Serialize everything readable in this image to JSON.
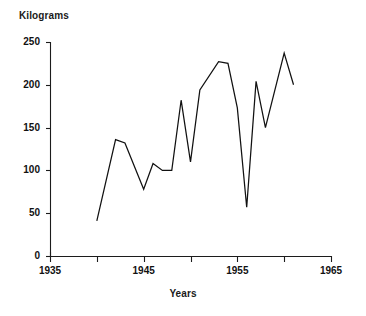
{
  "chart_data": {
    "type": "line",
    "title": "",
    "xlabel": "Years",
    "ylabel": "Kilograms",
    "xlim": [
      1935,
      1965
    ],
    "ylim": [
      0,
      250
    ],
    "grid": false,
    "legend": false,
    "x_major_ticks": [
      1935,
      1945,
      1955,
      1965
    ],
    "x_minor_ticks": [
      1940,
      1950,
      1960
    ],
    "x_tick_labels": [
      "1935",
      "1945",
      "1955",
      "1965"
    ],
    "y_ticks": [
      0,
      50,
      100,
      150,
      200,
      250
    ],
    "y_tick_labels": [
      "0",
      "50",
      "100",
      "150",
      "200",
      "250"
    ],
    "line_color": "#111111",
    "series": [
      {
        "name": "Kilograms",
        "x": [
          1940,
          1942,
          1943,
          1945,
          1946,
          1947,
          1948,
          1949,
          1950,
          1951,
          1953,
          1954,
          1955,
          1956,
          1957,
          1958,
          1960,
          1961
        ],
        "values": [
          41,
          136,
          132,
          78,
          108,
          100,
          100,
          182,
          110,
          194,
          227,
          225,
          173,
          57,
          204,
          150,
          237,
          200
        ]
      }
    ]
  },
  "axis_titles": {
    "y": "Kilograms",
    "x": "Years"
  }
}
